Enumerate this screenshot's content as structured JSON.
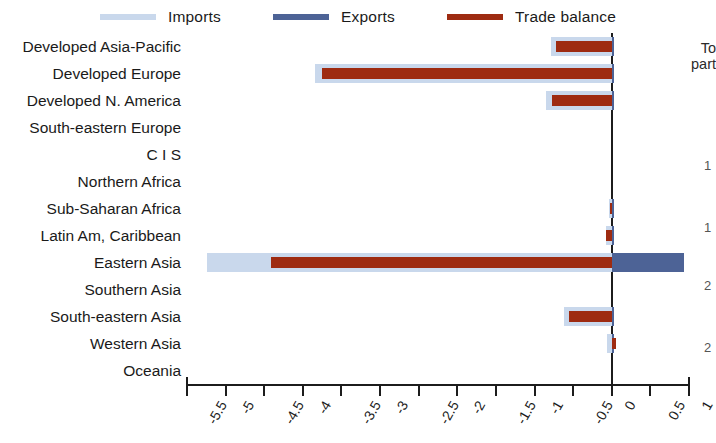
{
  "legend": {
    "items": [
      {
        "label": "Imports",
        "color": "#c9d8ec",
        "name": "legend-imports"
      },
      {
        "label": "Exports",
        "color": "#4d6396",
        "name": "legend-exports"
      },
      {
        "label": "Trade balance",
        "color": "#9e2b11",
        "name": "legend-trade-balance"
      }
    ]
  },
  "side_note": {
    "line1": "To",
    "line2": "part"
  },
  "side_numbers": [
    "1",
    "1",
    "2",
    "2"
  ],
  "chart_data": {
    "type": "bar",
    "orientation": "horizontal",
    "title": "",
    "xlabel": "",
    "ylabel": "",
    "xlim": [
      -5.5,
      1
    ],
    "xticks": [
      -5.5,
      -5,
      -4.5,
      -4,
      -3.5,
      -3,
      -2.5,
      -2,
      -1.5,
      -1,
      -0.5,
      0,
      0.5,
      1
    ],
    "xticklabels": [
      "-5.5",
      "-5",
      "-4.5",
      "-4",
      "-3.5",
      "-3",
      "-2.5",
      "-2",
      "-1.5",
      "-1",
      "-0.5",
      "0",
      "0.5",
      "1"
    ],
    "grid": false,
    "legend_position": "top",
    "categories": [
      "Developed Asia-Pacific",
      "Developed Europe",
      "Developed N. America",
      "South-eastern Europe",
      "C I S",
      "Northern Africa",
      "Sub-Saharan Africa",
      "Latin Am, Caribbean",
      "Eastern Asia",
      "Southern Asia",
      "South-eastern Asia",
      "Western Asia",
      "Oceania"
    ],
    "series": [
      {
        "name": "Imports",
        "color": "#c9d8ec",
        "values": [
          -0.79,
          -3.84,
          -0.85,
          0,
          0,
          0,
          -0.03,
          -0.08,
          -5.24,
          0,
          -0.62,
          -0.06,
          0
        ]
      },
      {
        "name": "Exports",
        "color": "#4d6396",
        "values": [
          0.02,
          0.03,
          0.02,
          0,
          0,
          0,
          0.01,
          0.01,
          0.93,
          0,
          0.02,
          0.03,
          0
        ]
      },
      {
        "name": "Trade balance",
        "color": "#9e2b11",
        "values": [
          -0.72,
          -3.75,
          -0.78,
          0,
          0,
          0,
          -0.02,
          -0.07,
          -4.41,
          0,
          -0.55,
          0.05,
          0
        ]
      }
    ]
  }
}
